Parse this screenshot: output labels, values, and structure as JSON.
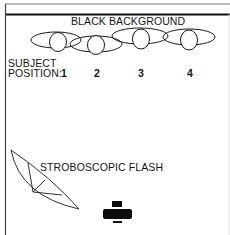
{
  "diagram": {
    "background_label": "BLACK BACKGROUND",
    "subject_label_line1": "SUBJECT",
    "subject_label_line2": "POSITION:",
    "positions": [
      "1",
      "2",
      "3",
      "4"
    ],
    "flash_label": "STROBOSCOPIC FLASH",
    "icons": {
      "flash": "stroboscopic-flash-reflector-icon",
      "camera": "camera-icon"
    },
    "colors": {
      "line": "#1a1a1a",
      "background": "#ffffff"
    }
  }
}
